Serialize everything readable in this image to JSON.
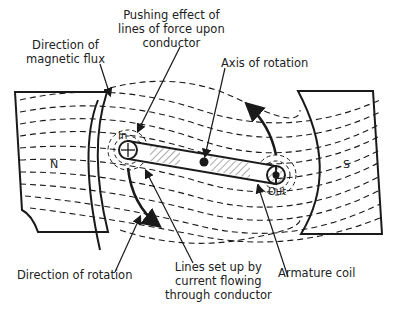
{
  "diagram": {
    "type": "dc-motor-principle",
    "labels": {
      "pushing_effect": [
        "Pushing effect of",
        "lines of force upon",
        "conductor"
      ],
      "magnetic_flux": [
        "Direction of",
        "magnetic flux"
      ],
      "axis": "Axis of rotation",
      "rotation": "Direction of rotation",
      "lines_set_up": [
        "Lines set up by",
        "current flowing",
        "through conductor"
      ],
      "armature": "Armature coil"
    },
    "poles": {
      "north": "N",
      "south": "S"
    },
    "conductors": {
      "in": "In",
      "out": "Out"
    },
    "colors": {
      "ink": "#1a1a1a",
      "background": "#ffffff"
    }
  }
}
